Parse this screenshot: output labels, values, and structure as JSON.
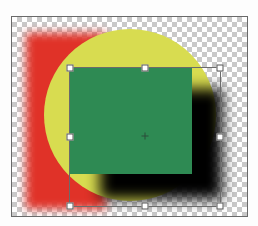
{
  "canvas": {
    "transparency": "checkerboard",
    "layers": [
      {
        "name": "red-rectangle",
        "color": "#e03228",
        "blur": true
      },
      {
        "name": "yellow-circle",
        "color": "#d8dc50"
      },
      {
        "name": "drop-shadow",
        "color": "#000000"
      },
      {
        "name": "green-square",
        "color": "#2e8a53"
      }
    ],
    "transform_box": {
      "handles": [
        "top-left",
        "top-middle",
        "top-right",
        "middle-left",
        "middle-right",
        "bottom-left",
        "bottom-middle",
        "bottom-right"
      ],
      "center_point": true
    }
  }
}
